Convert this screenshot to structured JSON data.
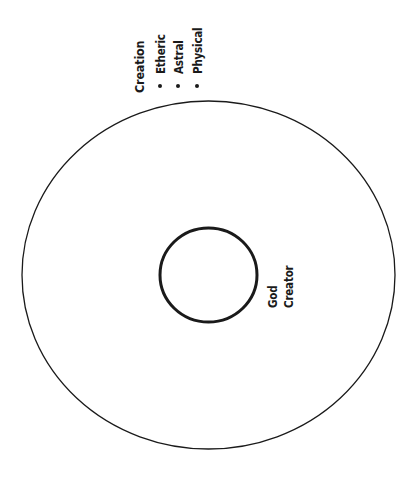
{
  "diagram": {
    "outer_circle": {
      "label": "Creation",
      "items": [
        "Etheric",
        "Astral",
        "Physical"
      ]
    },
    "inner_circle": {
      "labels": [
        "God",
        "Creator"
      ]
    }
  },
  "colors": {
    "stroke": "#1a1a1a",
    "background": "#ffffff"
  }
}
